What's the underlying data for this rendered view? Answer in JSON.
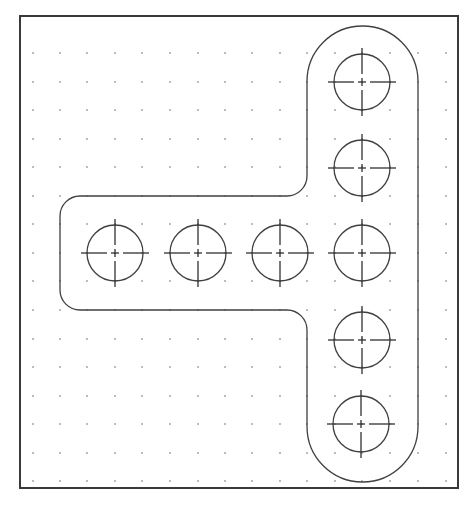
{
  "caption": "",
  "drawing": {
    "title": "T-shaped plate with hole pattern",
    "colors": {
      "background": "#ffffff",
      "frame": "#3a3a3a",
      "outline": "#404040",
      "grid_dot": "#8a8a8a"
    },
    "frame": {
      "x": 20,
      "y": 16,
      "width": 438,
      "height": 472
    },
    "grid": {
      "columns": [
        33,
        60,
        87,
        115,
        142,
        170,
        198,
        225,
        252,
        280,
        307,
        335,
        362,
        390,
        418,
        446
      ],
      "rows": [
        53,
        82,
        110,
        139,
        167,
        196,
        224,
        253,
        281,
        310,
        339,
        367,
        396,
        424,
        453,
        481
      ]
    },
    "vertical_slot": {
      "left": 307,
      "right": 418,
      "top": 26,
      "bottom": 482,
      "end_radius": 55.5
    },
    "horizontal_arm": {
      "left": 60,
      "top": 196,
      "bottom": 310,
      "corner_radius": 20,
      "fillet_radius": 20
    },
    "hole_radius": 28,
    "centerline_extent": 34,
    "holes": [
      {
        "id": "h-top",
        "cx": 362,
        "cy": 82
      },
      {
        "id": "h-upper",
        "cx": 362,
        "cy": 168
      },
      {
        "id": "h-left-1",
        "cx": 115,
        "cy": 253
      },
      {
        "id": "h-left-2",
        "cx": 198,
        "cy": 253
      },
      {
        "id": "h-left-3",
        "cx": 280,
        "cy": 253
      },
      {
        "id": "h-center",
        "cx": 362,
        "cy": 253
      },
      {
        "id": "h-lower",
        "cx": 362,
        "cy": 340
      },
      {
        "id": "h-bottom",
        "cx": 361,
        "cy": 424
      }
    ]
  }
}
